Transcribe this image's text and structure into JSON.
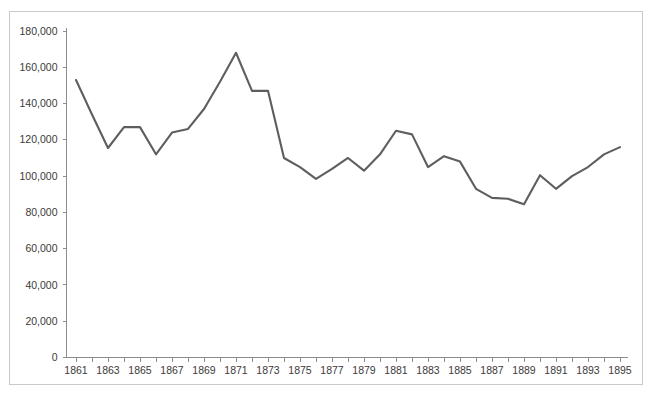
{
  "chart_data": {
    "type": "line",
    "title": "",
    "subtitle": "",
    "xlabel": "",
    "ylabel": "",
    "grid": false,
    "legend": false,
    "legend_position": "none",
    "line_color": "#5e5e5e",
    "axis_color": "#8c8c8c",
    "background_color": "#ffffff",
    "xlim": [
      1861,
      1895
    ],
    "ylim": [
      0,
      180000
    ],
    "y_ticks": [
      0,
      20000,
      40000,
      60000,
      80000,
      100000,
      120000,
      140000,
      160000,
      180000
    ],
    "y_tick_labels": [
      "0",
      "20,000",
      "40,000",
      "60,000",
      "80,000",
      "100,000",
      "120,000",
      "140,000",
      "160,000",
      "180,000"
    ],
    "x_ticks": [
      1861,
      1862,
      1863,
      1864,
      1865,
      1866,
      1867,
      1868,
      1869,
      1870,
      1871,
      1872,
      1873,
      1874,
      1875,
      1876,
      1877,
      1878,
      1879,
      1880,
      1881,
      1882,
      1883,
      1884,
      1885,
      1886,
      1887,
      1888,
      1889,
      1890,
      1891,
      1892,
      1893,
      1894,
      1895
    ],
    "x_tick_labels": [
      "1861",
      "",
      "1863",
      "",
      "1865",
      "",
      "1867",
      "",
      "1869",
      "",
      "1871",
      "",
      "1873",
      "",
      "1875",
      "",
      "1877",
      "",
      "1879",
      "",
      "1881",
      "",
      "1883",
      "",
      "1885",
      "",
      "1887",
      "",
      "1889",
      "",
      "1891",
      "",
      "1893",
      "",
      "1895"
    ],
    "x": [
      1861,
      1862,
      1863,
      1864,
      1865,
      1866,
      1867,
      1868,
      1869,
      1870,
      1871,
      1872,
      1873,
      1874,
      1875,
      1876,
      1877,
      1878,
      1879,
      1880,
      1881,
      1882,
      1883,
      1884,
      1885,
      1886,
      1887,
      1888,
      1889,
      1890,
      1891,
      1892,
      1893,
      1894,
      1895
    ],
    "values": [
      153000,
      134000,
      115500,
      127000,
      127000,
      112000,
      124000,
      126000,
      137000,
      152000,
      168000,
      147000,
      147000,
      110000,
      105000,
      98500,
      104000,
      110000,
      103000,
      112000,
      125000,
      123000,
      105000,
      111000,
      108000,
      93000,
      88000,
      87500,
      84500,
      100500,
      93000,
      100000,
      105000,
      112000,
      116000
    ],
    "series": [
      {
        "name": "series-1",
        "values": [
          153000,
          134000,
          115500,
          127000,
          127000,
          112000,
          124000,
          126000,
          137000,
          152000,
          168000,
          147000,
          147000,
          110000,
          105000,
          98500,
          104000,
          110000,
          103000,
          112000,
          125000,
          123000,
          105000,
          111000,
          108000,
          93000,
          88000,
          87500,
          84500,
          100500,
          93000,
          100000,
          105000,
          112000,
          116000
        ]
      }
    ],
    "annotations": []
  },
  "caption": {
    "text": ""
  }
}
